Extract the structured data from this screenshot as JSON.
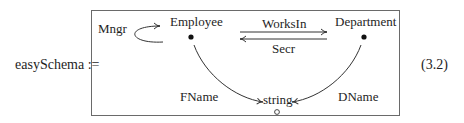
{
  "equation": {
    "lhs": "easySchema :=",
    "number": "(3.2)"
  },
  "diagram": {
    "nodes": [
      {
        "id": "employee",
        "label": "Employee",
        "marker": "filled-dot"
      },
      {
        "id": "department",
        "label": "Department",
        "marker": "filled-dot"
      },
      {
        "id": "string",
        "label": "string",
        "marker": "hollow-circle"
      }
    ],
    "edges": [
      {
        "id": "mngr",
        "label": "Mngr",
        "from": "employee",
        "to": "employee",
        "kind": "self-loop"
      },
      {
        "id": "worksin",
        "label": "WorksIn",
        "from": "employee",
        "to": "department"
      },
      {
        "id": "secr",
        "label": "Secr",
        "from": "department",
        "to": "employee"
      },
      {
        "id": "fname",
        "label": "FName",
        "from": "employee",
        "to": "string"
      },
      {
        "id": "dname",
        "label": "DName",
        "from": "department",
        "to": "string"
      }
    ]
  }
}
